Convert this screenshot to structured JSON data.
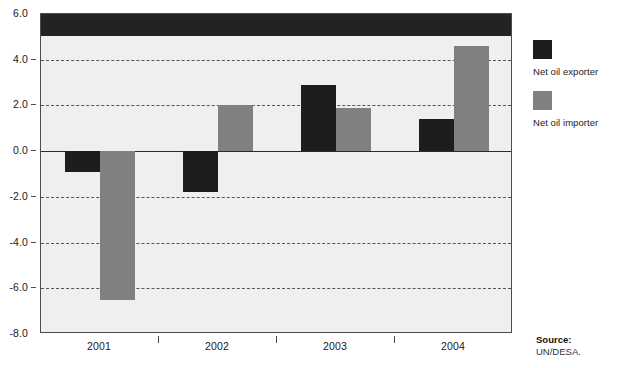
{
  "chart_data": {
    "type": "bar",
    "title": "",
    "subtitle": "",
    "xlabel": "",
    "ylabel": "",
    "categories": [
      "2001",
      "2002",
      "2003",
      "2004"
    ],
    "series": [
      {
        "name": "Net oil exporter",
        "color": "#1d1d1d",
        "values": [
          -0.9,
          -1.8,
          2.9,
          1.4
        ]
      },
      {
        "name": "Net oil importer",
        "color": "#808080",
        "values": [
          -6.5,
          2.0,
          1.9,
          4.6
        ]
      }
    ],
    "ylim": [
      -8.0,
      6.0
    ],
    "yticks": [
      6.0,
      4.0,
      2.0,
      0.0,
      -2.0,
      -4.0,
      -6.0,
      -8.0
    ],
    "ytick_labels": [
      "6.0",
      "4.0",
      "2.0",
      "0.0",
      "-2.0",
      "-4.0",
      "-6.0",
      "-8.0"
    ],
    "grid": true,
    "grid_style": "dashed",
    "legend_position": "right"
  },
  "legend": {
    "items": [
      {
        "label": "Net oil exporter",
        "swatch": "dark-swatch-icon"
      },
      {
        "label": "Net oil importer",
        "swatch": "gray-swatch-icon"
      }
    ]
  },
  "source": {
    "label": "Source:",
    "value": "UN/DESA."
  }
}
